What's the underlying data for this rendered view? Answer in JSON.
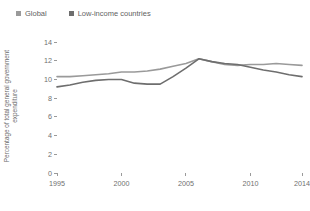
{
  "chart_data": {
    "type": "line",
    "title": "",
    "xlabel": "",
    "ylabel": "Percentage of total general government expenditure",
    "xlim": [
      1995,
      2014
    ],
    "ylim": [
      0,
      14
    ],
    "grid": false,
    "legend_position": "top-left",
    "xticks": [
      1995,
      2000,
      2005,
      2010,
      2014
    ],
    "yticks": [
      0,
      2,
      4,
      6,
      8,
      10,
      12,
      14
    ],
    "x": [
      1995,
      1996,
      1997,
      1998,
      1999,
      2000,
      2001,
      2002,
      2003,
      2004,
      2005,
      2006,
      2007,
      2008,
      2009,
      2010,
      2011,
      2012,
      2013,
      2014
    ],
    "series": [
      {
        "name": "Global",
        "color": "#9a9a9a",
        "values": [
          10.3,
          10.3,
          10.4,
          10.5,
          10.6,
          10.8,
          10.8,
          10.9,
          11.1,
          11.4,
          11.7,
          12.2,
          11.9,
          11.6,
          11.5,
          11.6,
          11.6,
          11.7,
          11.6,
          11.5
        ]
      },
      {
        "name": "Low-income countries",
        "color": "#6e6e6e",
        "values": [
          9.2,
          9.4,
          9.7,
          9.9,
          10.0,
          10.0,
          9.6,
          9.5,
          9.5,
          10.3,
          11.2,
          12.2,
          11.9,
          11.7,
          11.6,
          11.3,
          11.0,
          10.8,
          10.5,
          10.3
        ]
      }
    ]
  },
  "legend": {
    "items": [
      {
        "label": "Global",
        "color": "#9a9a9a"
      },
      {
        "label": "Low-income countries",
        "color": "#6e6e6e"
      }
    ]
  }
}
